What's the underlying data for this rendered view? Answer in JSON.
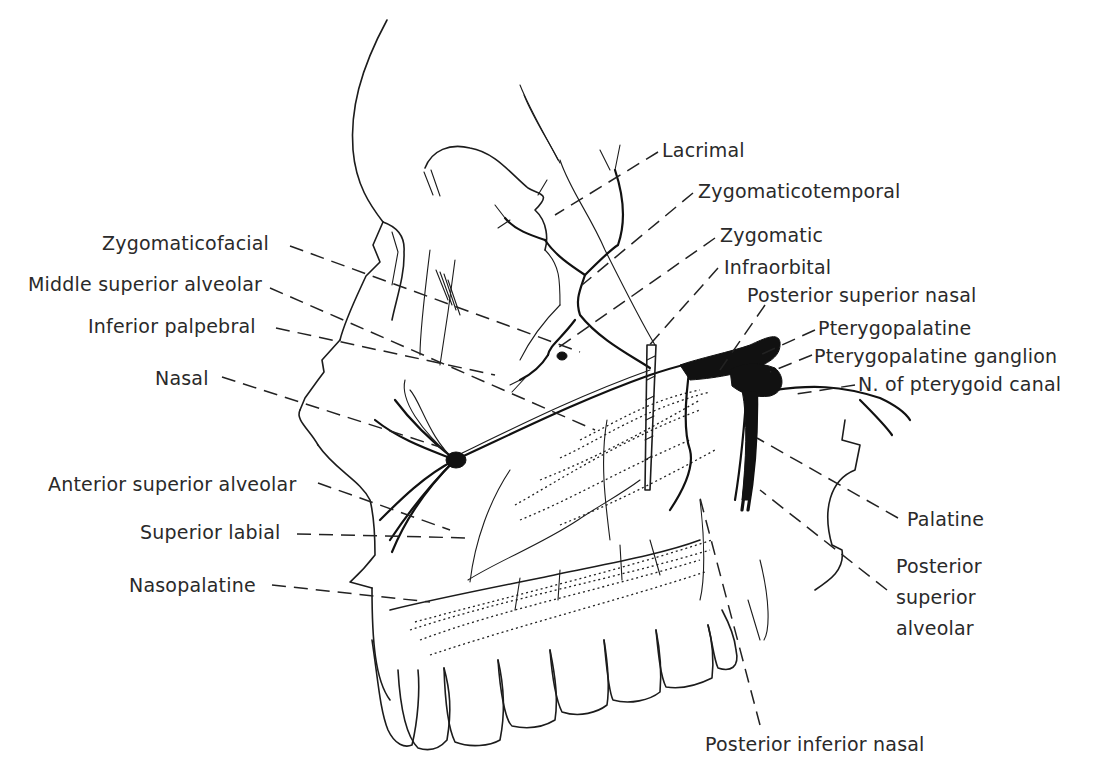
{
  "figure": {
    "ink_color": "#1c1c1c",
    "background_color": "#ffffff"
  },
  "labels": {
    "left": [
      {
        "id": "zygomaticofacial",
        "text": "Zygomaticofacial",
        "x": 102,
        "y": 232
      },
      {
        "id": "middle_superior_alveolar",
        "text": "Middle superior alveolar",
        "x": 28,
        "y": 273
      },
      {
        "id": "inferior_palpebral",
        "text": "Inferior palpebral",
        "x": 88,
        "y": 315
      },
      {
        "id": "nasal",
        "text": "Nasal",
        "x": 155,
        "y": 367
      },
      {
        "id": "anterior_superior_alveolar",
        "text": "Anterior superior alveolar",
        "x": 48,
        "y": 474
      },
      {
        "id": "superior_labial",
        "text": "Superior labial",
        "x": 140,
        "y": 522
      },
      {
        "id": "nasopalatine",
        "text": "Nasopalatine",
        "x": 129,
        "y": 575
      }
    ],
    "right": [
      {
        "id": "lacrimal",
        "text": "Lacrimal",
        "x": 662,
        "y": 139
      },
      {
        "id": "zygomaticotemporal",
        "text": "Zygomaticotemporal",
        "x": 698,
        "y": 180
      },
      {
        "id": "zygomatic",
        "text": "Zygomatic",
        "x": 720,
        "y": 225
      },
      {
        "id": "infraorbital",
        "text": "Infraorbital",
        "x": 724,
        "y": 257
      },
      {
        "id": "posterior_superior_nasal",
        "text": "Posterior superior nasal",
        "x": 747,
        "y": 285
      },
      {
        "id": "pterygopalatine",
        "text": "Pterygopalatine",
        "x": 817,
        "y": 318
      },
      {
        "id": "pterygopalatine_ganglion",
        "text": "Pterygopalatine ganglion",
        "x": 813,
        "y": 346
      },
      {
        "id": "n_of_pterygoid_canal",
        "text": "N. of pterygoid canal",
        "x": 857,
        "y": 374
      },
      {
        "id": "palatine",
        "text": "Palatine",
        "x": 906,
        "y": 509
      },
      {
        "id": "posterior_superior_alveolar_1",
        "text": "Posterior",
        "x": 895,
        "y": 556
      },
      {
        "id": "posterior_superior_alveolar_2",
        "text": "superior",
        "x": 895,
        "y": 587
      },
      {
        "id": "posterior_superior_alveolar_3",
        "text": "alveolar",
        "x": 895,
        "y": 618
      },
      {
        "id": "posterior_inferior_nasal",
        "text": "Posterior inferior nasal",
        "x": 705,
        "y": 735
      }
    ]
  }
}
